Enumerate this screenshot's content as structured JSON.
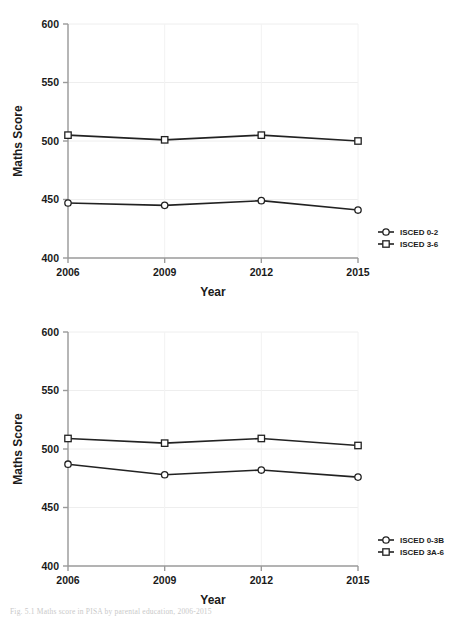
{
  "figure": {
    "caption": "Fig. 5.1 Maths score in PISA by parental education, 2006-2015"
  },
  "chart_data": [
    {
      "id": "top",
      "type": "line",
      "title": "",
      "xlabel": "Year",
      "ylabel": "Maths Score",
      "categories": [
        "2006",
        "2009",
        "2012",
        "2015"
      ],
      "x": [
        2006,
        2009,
        2012,
        2015
      ],
      "ylim": [
        400,
        600
      ],
      "yticks": [
        400,
        450,
        500,
        550,
        600
      ],
      "xticks": [
        "2006",
        "2009",
        "2012",
        "2015"
      ],
      "grid": true,
      "legend_position": "right",
      "series": [
        {
          "name": "ISCED 0-2",
          "marker": "circle",
          "color": "#222222",
          "values": [
            447,
            445,
            449,
            441
          ]
        },
        {
          "name": "ISCED 3-6",
          "marker": "square",
          "color": "#222222",
          "values": [
            505,
            501,
            505,
            500
          ]
        }
      ]
    },
    {
      "id": "bottom",
      "type": "line",
      "title": "",
      "xlabel": "Year",
      "ylabel": "Maths Score",
      "categories": [
        "2006",
        "2009",
        "2012",
        "2015"
      ],
      "x": [
        2006,
        2009,
        2012,
        2015
      ],
      "ylim": [
        400,
        600
      ],
      "yticks": [
        400,
        450,
        500,
        550,
        600
      ],
      "xticks": [
        "2006",
        "2009",
        "2012",
        "2015"
      ],
      "grid": true,
      "legend_position": "right",
      "series": [
        {
          "name": "ISCED 0-3B",
          "marker": "circle",
          "color": "#222222",
          "values": [
            487,
            478,
            482,
            476
          ]
        },
        {
          "name": "ISCED 3A-6",
          "marker": "square",
          "color": "#222222",
          "values": [
            509,
            505,
            509,
            503
          ]
        }
      ]
    }
  ]
}
